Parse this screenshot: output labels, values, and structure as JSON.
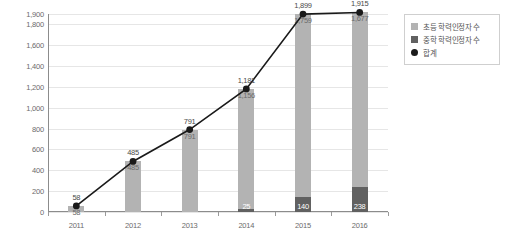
{
  "chart_data": {
    "type": "bar",
    "title": "",
    "subtitle": "",
    "xlabel": "",
    "ylabel": "",
    "categories": [
      "2011",
      "2012",
      "2013",
      "2014",
      "2015",
      "2016"
    ],
    "ylim": [
      0,
      1900
    ],
    "yticks": [
      0,
      200,
      400,
      600,
      800,
      1000,
      1200,
      1400,
      1600,
      1800,
      1900
    ],
    "ytick_labels": [
      "0",
      "200",
      "400",
      "600",
      "800",
      "1,000",
      "1,200",
      "1,400",
      "1,600",
      "1,800",
      "1,900"
    ],
    "grid": true,
    "legend_position": "right",
    "series": [
      {
        "name": "초등 학력인정자 수",
        "type": "bar",
        "color": "#b3b3b3",
        "values": [
          58,
          485,
          791,
          1156,
          1759,
          1677
        ],
        "labels": [
          "58",
          "485",
          "791",
          "1,156",
          "1,759",
          "1,677"
        ]
      },
      {
        "name": "중학 학력인정자 수",
        "type": "bar",
        "color": "#616161",
        "values": [
          0,
          0,
          0,
          25,
          140,
          238
        ],
        "labels": [
          "",
          "",
          "",
          "25",
          "140",
          "238"
        ]
      },
      {
        "name": "합계",
        "type": "line",
        "color": "#1a1a1a",
        "values": [
          58,
          485,
          791,
          1181,
          1899,
          1915
        ],
        "labels": [
          "58",
          "485",
          "791",
          "1,181",
          "1,899",
          "1,915"
        ]
      }
    ]
  },
  "legend": {
    "items": [
      {
        "label": "초등 학력인정자 수",
        "marker": "square-light",
        "color": "#b3b3b3"
      },
      {
        "label": "중학 학력인정자 수",
        "marker": "square-dark",
        "color": "#616161"
      },
      {
        "label": "합계",
        "marker": "circle-black",
        "color": "#1a1a1a"
      }
    ]
  },
  "axis": {
    "y_color": "#8c8c8c",
    "x_color": "#8c8c8c",
    "grid_color": "#e6e6e6"
  }
}
